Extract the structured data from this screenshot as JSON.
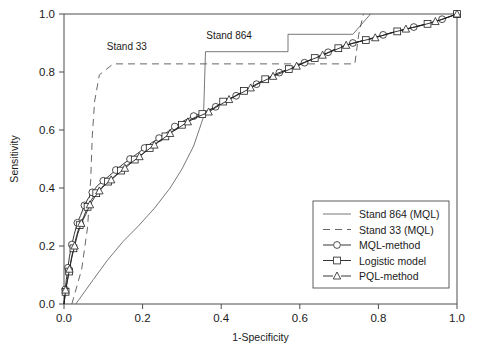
{
  "chart_data": {
    "type": "line",
    "title": "",
    "xlabel": "1-Specificity",
    "ylabel": "Sensitivity",
    "xlim": [
      0.0,
      1.0
    ],
    "ylim": [
      0.0,
      1.0
    ],
    "xticks": [
      "0.0",
      "0.2",
      "0.4",
      "0.6",
      "0.8",
      "1.0"
    ],
    "yticks": [
      "0.0",
      "0.2",
      "0.4",
      "0.6",
      "0.8",
      "1.0"
    ],
    "grid": false,
    "legend_position": "lower-right",
    "annotations": [
      {
        "text": "Stand 33",
        "x": 0.16,
        "y": 0.875
      },
      {
        "text": "Stand 864",
        "x": 0.42,
        "y": 0.915
      }
    ],
    "series": [
      {
        "name": "Stand 864 (MQL)",
        "style": "solid",
        "marker": "none",
        "points": [
          [
            0.03,
            0.0
          ],
          [
            0.075,
            0.085
          ],
          [
            0.11,
            0.15
          ],
          [
            0.15,
            0.215
          ],
          [
            0.19,
            0.27
          ],
          [
            0.23,
            0.33
          ],
          [
            0.27,
            0.4
          ],
          [
            0.3,
            0.465
          ],
          [
            0.33,
            0.545
          ],
          [
            0.355,
            0.645
          ],
          [
            0.36,
            0.87
          ],
          [
            0.57,
            0.87
          ],
          [
            0.57,
            0.93
          ],
          [
            0.735,
            0.93
          ],
          [
            0.78,
            1.0
          ]
        ]
      },
      {
        "name": "Stand 33 (MQL)",
        "style": "dashed",
        "marker": "none",
        "points": [
          [
            0.02,
            0.0
          ],
          [
            0.045,
            0.12
          ],
          [
            0.06,
            0.265
          ],
          [
            0.068,
            0.43
          ],
          [
            0.072,
            0.58
          ],
          [
            0.078,
            0.7
          ],
          [
            0.09,
            0.79
          ],
          [
            0.125,
            0.828
          ],
          [
            0.74,
            0.828
          ],
          [
            0.75,
            0.93
          ],
          [
            0.762,
            1.0
          ]
        ]
      },
      {
        "name": "MQL-method",
        "style": "solid",
        "marker": "circle",
        "points": [
          [
            0.0,
            0.0
          ],
          [
            0.003,
            0.05
          ],
          [
            0.006,
            0.085
          ],
          [
            0.01,
            0.125
          ],
          [
            0.014,
            0.165
          ],
          [
            0.02,
            0.205
          ],
          [
            0.026,
            0.24
          ],
          [
            0.034,
            0.28
          ],
          [
            0.042,
            0.305
          ],
          [
            0.052,
            0.34
          ],
          [
            0.062,
            0.365
          ],
          [
            0.072,
            0.385
          ],
          [
            0.085,
            0.408
          ],
          [
            0.1,
            0.425
          ],
          [
            0.115,
            0.442
          ],
          [
            0.132,
            0.462
          ],
          [
            0.15,
            0.482
          ],
          [
            0.168,
            0.5
          ],
          [
            0.186,
            0.518
          ],
          [
            0.205,
            0.538
          ],
          [
            0.222,
            0.555
          ],
          [
            0.242,
            0.572
          ],
          [
            0.262,
            0.592
          ],
          [
            0.282,
            0.612
          ],
          [
            0.305,
            0.632
          ],
          [
            0.33,
            0.648
          ],
          [
            0.358,
            0.662
          ],
          [
            0.386,
            0.68
          ],
          [
            0.412,
            0.7
          ],
          [
            0.438,
            0.718
          ],
          [
            0.462,
            0.738
          ],
          [
            0.49,
            0.758
          ],
          [
            0.518,
            0.778
          ],
          [
            0.548,
            0.798
          ],
          [
            0.578,
            0.812
          ],
          [
            0.612,
            0.832
          ],
          [
            0.645,
            0.852
          ],
          [
            0.672,
            0.868
          ],
          [
            0.7,
            0.885
          ],
          [
            0.735,
            0.9
          ],
          [
            0.772,
            0.912
          ],
          [
            0.812,
            0.928
          ],
          [
            0.852,
            0.942
          ],
          [
            0.89,
            0.955
          ],
          [
            0.928,
            0.968
          ],
          [
            0.962,
            0.982
          ],
          [
            1.0,
            1.0
          ]
        ]
      },
      {
        "name": "Logistic model",
        "style": "solid",
        "marker": "square",
        "points": [
          [
            0.0,
            0.0
          ],
          [
            0.004,
            0.042
          ],
          [
            0.008,
            0.078
          ],
          [
            0.013,
            0.112
          ],
          [
            0.018,
            0.152
          ],
          [
            0.024,
            0.192
          ],
          [
            0.032,
            0.235
          ],
          [
            0.04,
            0.272
          ],
          [
            0.05,
            0.3
          ],
          [
            0.06,
            0.335
          ],
          [
            0.07,
            0.36
          ],
          [
            0.082,
            0.382
          ],
          [
            0.096,
            0.402
          ],
          [
            0.112,
            0.422
          ],
          [
            0.128,
            0.44
          ],
          [
            0.145,
            0.46
          ],
          [
            0.162,
            0.48
          ],
          [
            0.18,
            0.498
          ],
          [
            0.2,
            0.518
          ],
          [
            0.218,
            0.538
          ],
          [
            0.238,
            0.558
          ],
          [
            0.258,
            0.578
          ],
          [
            0.278,
            0.598
          ],
          [
            0.3,
            0.618
          ],
          [
            0.325,
            0.638
          ],
          [
            0.352,
            0.655
          ],
          [
            0.38,
            0.675
          ],
          [
            0.405,
            0.698
          ],
          [
            0.432,
            0.715
          ],
          [
            0.458,
            0.735
          ],
          [
            0.485,
            0.755
          ],
          [
            0.512,
            0.775
          ],
          [
            0.542,
            0.795
          ],
          [
            0.572,
            0.81
          ],
          [
            0.605,
            0.83
          ],
          [
            0.638,
            0.848
          ],
          [
            0.668,
            0.865
          ],
          [
            0.698,
            0.882
          ],
          [
            0.73,
            0.898
          ],
          [
            0.768,
            0.91
          ],
          [
            0.808,
            0.925
          ],
          [
            0.848,
            0.94
          ],
          [
            0.886,
            0.953
          ],
          [
            0.925,
            0.966
          ],
          [
            0.96,
            0.98
          ],
          [
            1.0,
            1.0
          ]
        ]
      },
      {
        "name": "PQL-method",
        "style": "solid",
        "marker": "triangle",
        "points": [
          [
            0.0,
            0.0
          ],
          [
            0.004,
            0.048
          ],
          [
            0.009,
            0.082
          ],
          [
            0.014,
            0.12
          ],
          [
            0.02,
            0.16
          ],
          [
            0.027,
            0.2
          ],
          [
            0.035,
            0.242
          ],
          [
            0.044,
            0.278
          ],
          [
            0.055,
            0.308
          ],
          [
            0.066,
            0.342
          ],
          [
            0.078,
            0.368
          ],
          [
            0.09,
            0.39
          ],
          [
            0.104,
            0.41
          ],
          [
            0.12,
            0.428
          ],
          [
            0.137,
            0.448
          ],
          [
            0.155,
            0.468
          ],
          [
            0.172,
            0.488
          ],
          [
            0.192,
            0.508
          ],
          [
            0.21,
            0.528
          ],
          [
            0.23,
            0.548
          ],
          [
            0.25,
            0.568
          ],
          [
            0.27,
            0.588
          ],
          [
            0.292,
            0.608
          ],
          [
            0.315,
            0.628
          ],
          [
            0.34,
            0.645
          ],
          [
            0.368,
            0.662
          ],
          [
            0.395,
            0.685
          ],
          [
            0.42,
            0.705
          ],
          [
            0.448,
            0.725
          ],
          [
            0.475,
            0.745
          ],
          [
            0.502,
            0.765
          ],
          [
            0.532,
            0.785
          ],
          [
            0.562,
            0.802
          ],
          [
            0.592,
            0.82
          ],
          [
            0.625,
            0.84
          ],
          [
            0.658,
            0.858
          ],
          [
            0.688,
            0.875
          ],
          [
            0.718,
            0.892
          ],
          [
            0.752,
            0.905
          ],
          [
            0.792,
            0.918
          ],
          [
            0.832,
            0.935
          ],
          [
            0.87,
            0.948
          ],
          [
            0.908,
            0.96
          ],
          [
            0.945,
            0.974
          ],
          [
            0.975,
            0.988
          ],
          [
            1.0,
            1.0
          ]
        ]
      }
    ]
  },
  "legend": {
    "entries": [
      {
        "label": "Stand 864 (MQL)",
        "style": "solid",
        "marker": "none"
      },
      {
        "label": "Stand 33 (MQL)",
        "style": "dashed",
        "marker": "none"
      },
      {
        "label": "MQL-method",
        "style": "solid",
        "marker": "circle"
      },
      {
        "label": "Logistic model",
        "style": "solid",
        "marker": "square"
      },
      {
        "label": "PQL-method",
        "style": "solid",
        "marker": "triangle"
      }
    ]
  },
  "colors": {
    "background": "#ffffff",
    "axis": "#4d4d4d",
    "curve": "#1f1f1f",
    "thin_curve": "#555555",
    "text": "#1a1a1a"
  }
}
